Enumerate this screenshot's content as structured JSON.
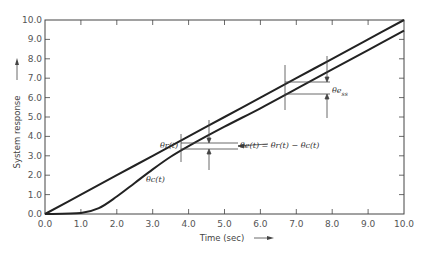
{
  "chart_data": {
    "type": "line",
    "title": "",
    "xlabel": "Time (sec)",
    "ylabel": "System response",
    "xlim": [
      0,
      10
    ],
    "ylim": [
      0,
      10
    ],
    "grid": false,
    "legend": "none (inline labels)",
    "x_ticks": [
      "0.0",
      "1.0",
      "2.0",
      "3.0",
      "4.0",
      "5.0",
      "6.0",
      "7.0",
      "8.0",
      "9.0",
      "10.0"
    ],
    "y_ticks": [
      "0.0",
      "1.0",
      "2.0",
      "3.0",
      "4.0",
      "5.0",
      "6.0",
      "7.0",
      "8.0",
      "9.0",
      "10.0"
    ],
    "series": [
      {
        "name": "θr(t)",
        "x": [
          0,
          1,
          2,
          3,
          4,
          5,
          6,
          7,
          8,
          9,
          10
        ],
        "y": [
          0,
          1,
          2,
          3,
          4,
          5,
          6,
          7,
          8,
          9,
          10
        ]
      },
      {
        "name": "θc(t)",
        "x": [
          0,
          1.0,
          1.5,
          2,
          2.5,
          3,
          3.5,
          4,
          5,
          6,
          7,
          8,
          9,
          10
        ],
        "y": [
          0,
          0.05,
          0.3,
          0.9,
          1.6,
          2.3,
          2.95,
          3.5,
          4.5,
          5.45,
          6.45,
          7.45,
          8.45,
          9.45
        ]
      }
    ],
    "annotations": [
      {
        "text": "θr(t)",
        "x": 3.0,
        "y": 3.8
      },
      {
        "text": "θc(t)",
        "x": 3.0,
        "y": 2.5
      },
      {
        "text": "θe(t) = θr(t) − θc(t)",
        "x": 5.0,
        "y": 3.6,
        "marker_x": 4.5
      },
      {
        "text": "θe_ss",
        "x": 8.2,
        "y": 6.3,
        "marker_x": 7.8
      }
    ]
  },
  "labels": {
    "xlabel": "Time (sec)",
    "ylabel": "System response",
    "theta_r": "θr(t)",
    "theta_c": "θc(t)",
    "error_eq": "θe(t) = θr(t) − θc(t)",
    "ess": "θe",
    "ess_sub": "ss"
  }
}
